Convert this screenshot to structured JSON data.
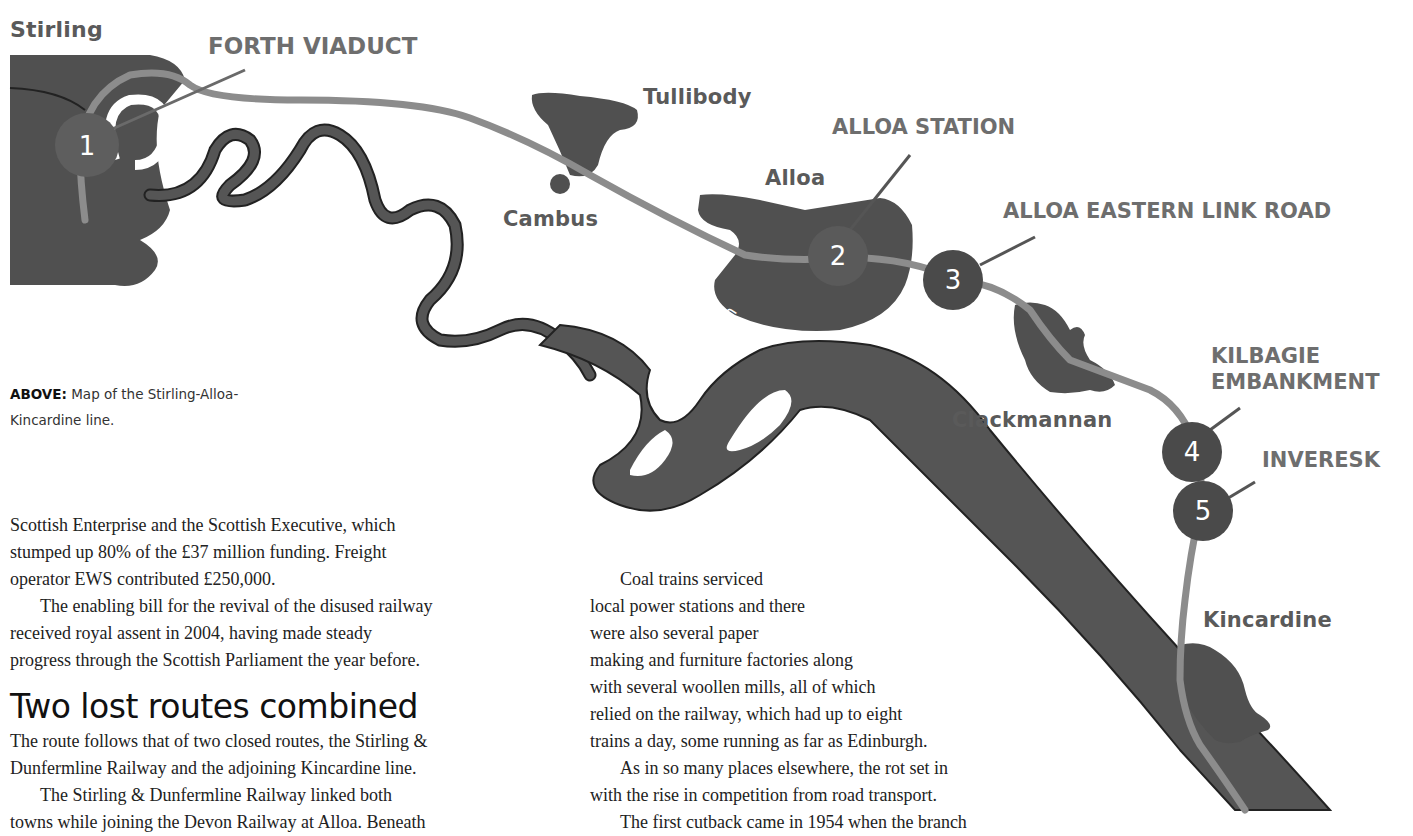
{
  "map": {
    "places": {
      "stirling": "Stirling",
      "tullibody": "Tullibody",
      "alloa": "Alloa",
      "cambus": "Cambus",
      "clackmannan": "Clackmannan",
      "kincardine": "Kincardine"
    },
    "river_label": "River Forth",
    "features": [
      {
        "number": "1",
        "label": "FORTH VIADUCT"
      },
      {
        "number": "2",
        "label": "ALLOA STATION"
      },
      {
        "number": "3",
        "label": "ALLOA EASTERN LINK ROAD"
      },
      {
        "number": "4",
        "label_line1": "KILBAGIE",
        "label_line2": "EMBANKMENT"
      },
      {
        "number": "5",
        "label": "INVERESK"
      }
    ],
    "colors": {
      "land": "#505050",
      "river": "#555555",
      "railway": "#8c8c8c",
      "marker": "#4a4a4a",
      "marker_1": "#5e5e5e",
      "leader": "#6a6a6a"
    }
  },
  "caption": {
    "bold": "ABOVE:",
    "text": " Map of the Stirling-Alloa-Kincardine line."
  },
  "article": {
    "left_column": {
      "p1": [
        "Scottish Enterprise and the Scottish Executive, which",
        "stumped up 80% of the £37 million funding. Freight",
        "operator EWS contributed £250,000."
      ],
      "p2": [
        "The enabling bill for the revival of the disused railway",
        "received royal assent in 2004, having made steady",
        "progress through the Scottish Parliament the year before."
      ],
      "heading": "Two lost routes combined",
      "p3": [
        "The route follows that of two closed routes, the Stirling &",
        "Dunfermline Railway and the adjoining Kincardine line."
      ],
      "p4": [
        "The Stirling & Dunfermline Railway linked both",
        "towns while joining the Devon Railway at Alloa. Beneath"
      ]
    },
    "right_column": {
      "p1": [
        "Coal trains serviced",
        "local power stations and there",
        "were also several paper",
        "making and furniture factories along",
        "with several woollen mills, all of which",
        "relied on the railway, which had up to eight",
        "trains a day, some running as far as Edinburgh."
      ],
      "p2": [
        "As in so many places elsewhere, the rot set in",
        "with the rise in competition from road transport."
      ],
      "p3": [
        "The first cutback came in 1954 when the branch"
      ]
    }
  }
}
